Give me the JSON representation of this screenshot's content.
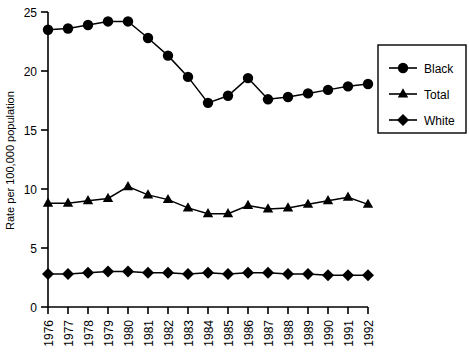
{
  "chart_data": {
    "type": "line",
    "title": "",
    "xlabel": "",
    "ylabel": "Rate per 100,000 population",
    "x": [
      1976,
      1977,
      1978,
      1979,
      1980,
      1981,
      1982,
      1983,
      1984,
      1985,
      1986,
      1987,
      1988,
      1989,
      1990,
      1991,
      1992
    ],
    "categories": [
      "1976",
      "1977",
      "1978",
      "1979",
      "1980",
      "1981",
      "1982",
      "1983",
      "1984",
      "1985",
      "1986",
      "1987",
      "1988",
      "1989",
      "1990",
      "1991",
      "1992"
    ],
    "xlim": [
      1976,
      1992
    ],
    "ylim": [
      0,
      25
    ],
    "yticks": [
      0,
      5,
      10,
      15,
      20,
      25
    ],
    "ytick_labels": [
      "0",
      "5",
      "10",
      "15",
      "20",
      "25"
    ],
    "grid": false,
    "legend_position": "right",
    "series": [
      {
        "name": "Black",
        "marker": "circle",
        "color": "#000000",
        "values": [
          23.5,
          23.6,
          23.9,
          24.2,
          24.2,
          22.8,
          21.3,
          19.5,
          17.3,
          17.9,
          19.4,
          17.6,
          17.8,
          18.1,
          18.4,
          18.7,
          18.9
        ]
      },
      {
        "name": "Total",
        "marker": "triangle",
        "color": "#000000",
        "values": [
          8.8,
          8.8,
          9.0,
          9.2,
          10.2,
          9.5,
          9.1,
          8.4,
          7.9,
          7.9,
          8.6,
          8.3,
          8.4,
          8.7,
          9.0,
          9.3,
          8.7
        ]
      },
      {
        "name": "White",
        "marker": "diamond",
        "color": "#000000",
        "values": [
          2.8,
          2.8,
          2.9,
          3.0,
          3.0,
          2.9,
          2.9,
          2.8,
          2.9,
          2.8,
          2.9,
          2.9,
          2.8,
          2.8,
          2.7,
          2.7,
          2.7
        ]
      }
    ]
  },
  "legend": {
    "items": [
      {
        "label": "Black",
        "marker": "circle-marker"
      },
      {
        "label": "Total",
        "marker": "triangle-marker"
      },
      {
        "label": "White",
        "marker": "diamond-marker"
      }
    ]
  }
}
